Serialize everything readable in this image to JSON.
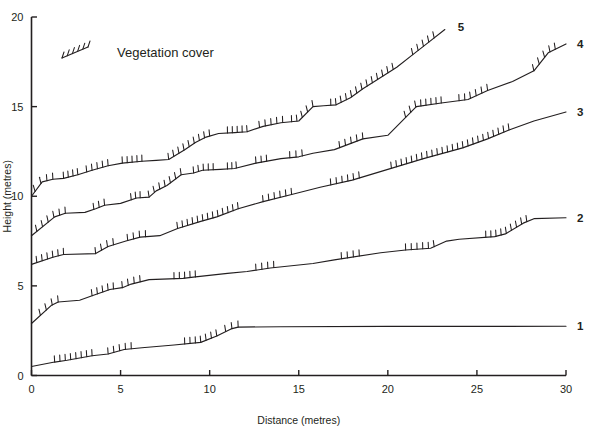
{
  "figure": {
    "background": "#ffffff",
    "ink_color": "#231f20"
  },
  "legend": {
    "label": "Vegetation cover",
    "swatch_name": "vegetation-hatch-swatch",
    "x_px": 62,
    "y_px": 52
  },
  "chart_data": {
    "type": "line",
    "title": "",
    "subtitle": "",
    "xlabel": "Distance (metres)",
    "ylabel": "Height (metres)",
    "xlim": [
      0,
      30
    ],
    "ylim": [
      0,
      20
    ],
    "xticks": [
      0,
      5,
      10,
      15,
      20,
      25,
      30
    ],
    "xticklabels": [
      "0",
      "5",
      "10",
      "15",
      "20",
      "25",
      "30"
    ],
    "yticks": [
      0,
      5,
      10,
      15,
      20
    ],
    "yticklabels": [
      "0",
      "5",
      "10",
      "15",
      "20"
    ],
    "grid": false,
    "legend_position": "upper-left-inside",
    "annotations": [
      "Vegetation cover"
    ],
    "series_label_position": "right-end-of-line",
    "note": "Five surveyed dune transect profiles; hatched tick marks along the profile lines indicate stretches with vegetation cover.",
    "series": [
      {
        "name": "1",
        "label": "1",
        "label_x": 30.0,
        "label_y": 2.75,
        "x": [
          0.0,
          1.3,
          2.0,
          3.4,
          4.3,
          5.2,
          6.2,
          8.0,
          9.5,
          10.4,
          11.2,
          11.6,
          14.0,
          20.0,
          26.0,
          30.0
        ],
        "y": [
          0.5,
          0.75,
          0.85,
          1.1,
          1.2,
          1.45,
          1.55,
          1.7,
          1.85,
          2.2,
          2.6,
          2.7,
          2.72,
          2.74,
          2.74,
          2.75
        ],
        "vegetation_segments": [
          [
            1.3,
            3.4
          ],
          [
            4.3,
            5.6
          ],
          [
            8.6,
            10.4
          ],
          [
            10.9,
            11.6
          ]
        ]
      },
      {
        "name": "2",
        "label": "2",
        "label_x": 30.0,
        "label_y": 8.8,
        "x": [
          0.0,
          1.1,
          1.5,
          2.7,
          3.4,
          4.4,
          5.1,
          5.6,
          6.6,
          8.5,
          9.2,
          11.0,
          12.1,
          13.4,
          15.8,
          17.0,
          19.6,
          21.0,
          22.4,
          23.3,
          24.0,
          26.0,
          26.6,
          27.6,
          28.2,
          30.0
        ],
        "y": [
          2.9,
          3.9,
          4.1,
          4.2,
          4.45,
          4.8,
          4.9,
          5.1,
          5.35,
          5.42,
          5.5,
          5.7,
          5.8,
          6.0,
          6.25,
          6.45,
          6.85,
          7.0,
          7.1,
          7.5,
          7.6,
          7.75,
          7.9,
          8.5,
          8.75,
          8.8
        ],
        "vegetation_segments": [
          [
            0.5,
            1.5
          ],
          [
            3.4,
            4.6
          ],
          [
            5.1,
            6.1
          ],
          [
            8.0,
            9.2
          ],
          [
            12.6,
            13.6
          ],
          [
            17.4,
            18.4
          ],
          [
            21.0,
            22.6
          ],
          [
            25.5,
            27.8
          ]
        ]
      },
      {
        "name": "3",
        "label": "3",
        "label_x": 30.0,
        "label_y": 14.7,
        "x": [
          0.0,
          1.2,
          1.8,
          3.6,
          4.3,
          5.3,
          6.1,
          7.2,
          8.2,
          9.5,
          10.4,
          11.6,
          13.0,
          14.6,
          16.2,
          18.0,
          20.0,
          22.0,
          24.2,
          25.6,
          26.8,
          28.2,
          30.0
        ],
        "y": [
          6.2,
          6.6,
          6.75,
          6.8,
          7.2,
          7.5,
          7.72,
          7.8,
          8.2,
          8.6,
          8.85,
          9.3,
          9.7,
          10.1,
          10.5,
          10.9,
          11.5,
          12.1,
          12.7,
          13.2,
          13.7,
          14.2,
          14.7
        ],
        "vegetation_segments": [
          [
            0.3,
            1.8
          ],
          [
            3.6,
            4.6
          ],
          [
            5.4,
            6.4
          ],
          [
            8.2,
            11.6
          ],
          [
            13.0,
            14.6
          ],
          [
            16.8,
            18.4
          ],
          [
            20.2,
            26.8
          ]
        ]
      },
      {
        "name": "4",
        "label": "4",
        "label_x": 30.0,
        "label_y": 18.5,
        "x": [
          0.0,
          1.3,
          1.9,
          3.0,
          3.6,
          4.1,
          5.0,
          5.9,
          6.6,
          7.0,
          7.6,
          8.4,
          9.1,
          9.6,
          10.6,
          11.4,
          12.6,
          14.0,
          15.0,
          15.8,
          17.0,
          18.6,
          20.0,
          21.6,
          23.0,
          24.5,
          25.6,
          27.0,
          28.2,
          29.0,
          30.0
        ],
        "y": [
          7.8,
          8.85,
          9.05,
          9.1,
          9.3,
          9.5,
          9.6,
          9.9,
          9.95,
          10.3,
          10.6,
          11.2,
          11.3,
          11.45,
          11.5,
          11.55,
          11.85,
          12.1,
          12.2,
          12.4,
          12.6,
          13.2,
          13.4,
          15.0,
          15.2,
          15.4,
          15.9,
          16.4,
          17.0,
          18.0,
          18.5
        ],
        "vegetation_segments": [
          [
            0.3,
            1.9
          ],
          [
            3.5,
            4.1
          ],
          [
            5.6,
            6.1
          ],
          [
            6.6,
            8.4
          ],
          [
            9.1,
            10.2
          ],
          [
            11.0,
            11.5
          ],
          [
            12.6,
            13.2
          ],
          [
            14.5,
            15.2
          ],
          [
            17.3,
            18.6
          ],
          [
            21.0,
            23.0
          ],
          [
            24.0,
            25.6
          ],
          [
            28.2,
            29.4
          ]
        ]
      },
      {
        "name": "5",
        "label": "5",
        "label_x": 23.3,
        "label_y": 19.45,
        "x": [
          0.0,
          0.6,
          1.2,
          1.8,
          2.6,
          3.4,
          4.3,
          5.1,
          6.2,
          7.0,
          7.7,
          8.6,
          9.2,
          9.8,
          10.5,
          11.4,
          12.1,
          13.0,
          14.0,
          15.0,
          15.8,
          16.4,
          17.1,
          17.9,
          18.6,
          19.4,
          20.5,
          21.4,
          22.3,
          23.2
        ],
        "y": [
          10.0,
          10.8,
          10.95,
          11.0,
          11.2,
          11.45,
          11.7,
          11.85,
          11.95,
          12.0,
          12.05,
          12.6,
          13.0,
          13.3,
          13.5,
          13.55,
          13.6,
          13.9,
          14.1,
          14.2,
          15.0,
          15.05,
          15.1,
          15.5,
          16.0,
          16.5,
          17.2,
          17.9,
          18.6,
          19.3
        ],
        "vegetation_segments": [
          [
            0.2,
            1.2
          ],
          [
            1.8,
            2.6
          ],
          [
            3.1,
            4.3
          ],
          [
            5.1,
            6.2
          ],
          [
            7.7,
            10.0
          ],
          [
            11.0,
            12.1
          ],
          [
            12.8,
            14.1
          ],
          [
            14.6,
            15.8
          ],
          [
            16.8,
            20.3
          ],
          [
            21.4,
            22.6
          ]
        ]
      }
    ]
  }
}
